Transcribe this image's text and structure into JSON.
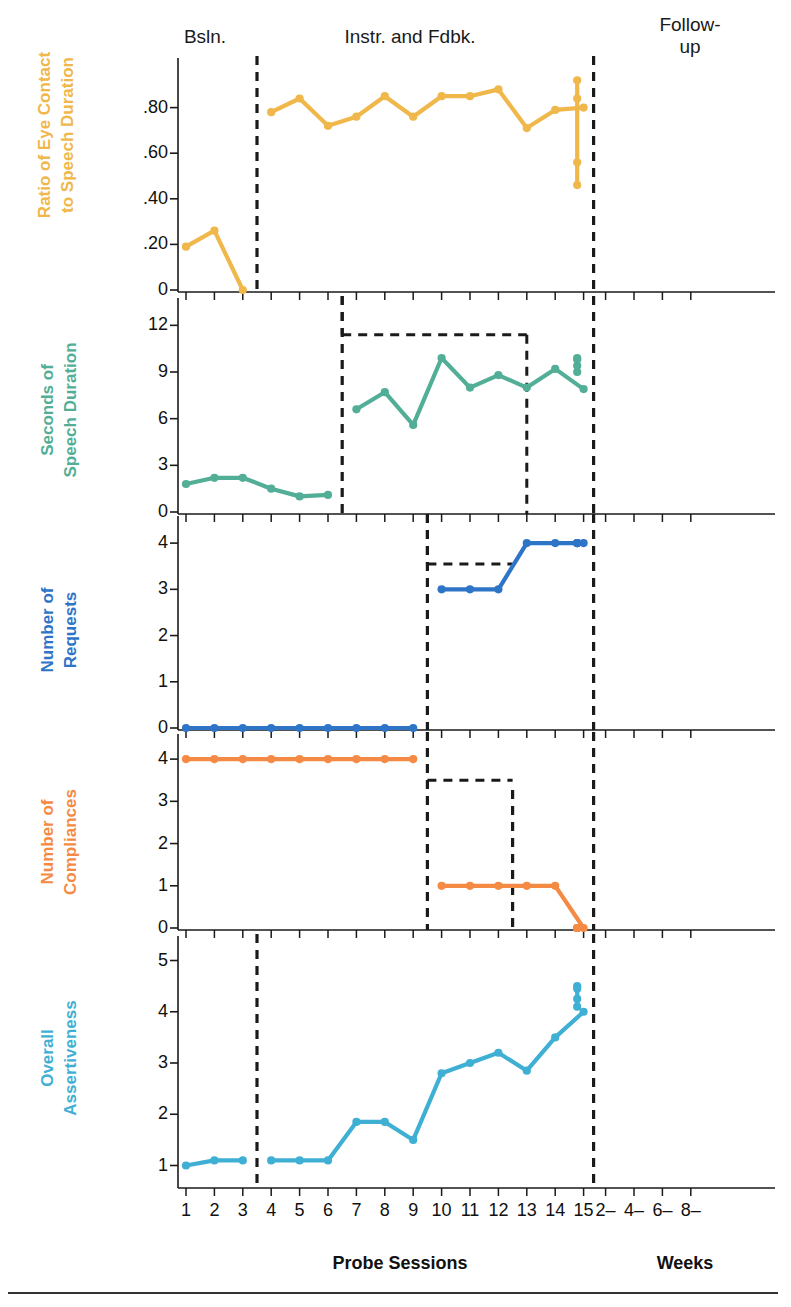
{
  "page": {
    "top_fragment": "",
    "background": "#ffffff"
  },
  "phase_labels": [
    {
      "name": "baseline",
      "text": "Bsln."
    },
    {
      "name": "intervention",
      "text": "Instr. and Fdbk."
    },
    {
      "name": "followup",
      "text": "Follow-\nup"
    }
  ],
  "phase_label_parts": {
    "baseline": "Bsln.",
    "intervention": "Instr. and Fdbk.",
    "followup_line1": "Follow-",
    "followup_line2": "up"
  },
  "axis": {
    "xlabel_sessions": "Probe Sessions",
    "xlabel_weeks": "Weeks",
    "session_ticks": [
      "1",
      "2",
      "3",
      "4",
      "5",
      "6",
      "7",
      "8",
      "9",
      "10",
      "11",
      "12",
      "13",
      "14",
      "15"
    ],
    "week_ticks": [
      "2–",
      "4–",
      "6–",
      "8–"
    ]
  },
  "colors": {
    "eye_contact": "#F0B74A",
    "speech": "#52AE96",
    "requests": "#2E75C8",
    "compliances": "#F58A44",
    "assertiveness": "#3FAFD4",
    "axis": "#1a1a1a",
    "phase_line": "#1a1a1a",
    "criterion_line": "#1a1a1a"
  },
  "chart_data": [
    {
      "type": "line",
      "panel": 1,
      "title": "",
      "ylabel": "Ratio of Eye Contact to Speech Duration",
      "ylabel_line1": "Ratio of Eye Contact",
      "ylabel_line2": "to Speech Duration",
      "xlabel": "Probe Sessions",
      "ylim": [
        0,
        1.0
      ],
      "yticks": [
        0,
        0.2,
        0.4,
        0.6,
        0.8
      ],
      "ytick_labels": [
        "0",
        ".20",
        ".40",
        ".60",
        ".80"
      ],
      "grid": false,
      "legend": "none",
      "color": "#F0B74A",
      "series": [
        {
          "name": "Baseline",
          "x": [
            1,
            2,
            3
          ],
          "values": [
            0.19,
            0.26,
            0.0
          ]
        },
        {
          "name": "Instruction and Feedback",
          "x": [
            4,
            5,
            6,
            7,
            8,
            9,
            10,
            11,
            12,
            13,
            14,
            15
          ],
          "values": [
            0.78,
            0.84,
            0.72,
            0.76,
            0.85,
            0.76,
            0.85,
            0.85,
            0.88,
            0.71,
            0.79,
            0.8
          ]
        },
        {
          "name": "Follow-up",
          "x": [
            "2-",
            "4-",
            "6-",
            "8-"
          ],
          "values": [
            0.56,
            0.92,
            0.84,
            0.46
          ]
        }
      ]
    },
    {
      "type": "line",
      "panel": 2,
      "ylabel": "Seconds of Speech Duration",
      "ylabel_line1": "Seconds of",
      "ylabel_line2": "Speech Duration",
      "ylim": [
        0,
        13.5
      ],
      "yticks": [
        0,
        3,
        6,
        9,
        12
      ],
      "ytick_labels": [
        "0",
        "3",
        "6",
        "9",
        "12"
      ],
      "grid": false,
      "legend": "none",
      "color": "#52AE96",
      "criterion_steps": [
        {
          "from_x": 6.5,
          "to_x": 13.0,
          "value": 11.4
        }
      ],
      "series": [
        {
          "name": "Baseline",
          "x": [
            1,
            2,
            3,
            4,
            5,
            6
          ],
          "values": [
            1.8,
            2.2,
            2.2,
            1.5,
            1.0,
            1.1
          ]
        },
        {
          "name": "Instruction and Feedback",
          "x": [
            7,
            8,
            9,
            10,
            11,
            12,
            13,
            14,
            15
          ],
          "values": [
            6.6,
            7.7,
            5.6,
            9.9,
            8.0,
            8.8,
            8.0,
            9.2,
            7.9
          ]
        },
        {
          "name": "Follow-up",
          "x": [
            "2-",
            "4-",
            "6-",
            "8-"
          ],
          "values": [
            9.4,
            9.8,
            9.0,
            9.9
          ]
        }
      ]
    },
    {
      "type": "line",
      "panel": 3,
      "ylabel": "Number of Requests",
      "ylabel_line1": "Number of",
      "ylabel_line2": "Requests",
      "ylim": [
        0,
        4.5
      ],
      "yticks": [
        0,
        1,
        2,
        3,
        4
      ],
      "ytick_labels": [
        "0",
        "1",
        "2",
        "3",
        "4"
      ],
      "grid": false,
      "legend": "none",
      "color": "#2E75C8",
      "criterion_steps": [
        {
          "from_x": 9.5,
          "to_x": 12.5,
          "value": 3.5
        }
      ],
      "series": [
        {
          "name": "Baseline",
          "x": [
            1,
            2,
            3,
            4,
            5,
            6,
            7,
            8,
            9
          ],
          "values": [
            0,
            0,
            0,
            0,
            0,
            0,
            0,
            0,
            0
          ]
        },
        {
          "name": "Instruction and Feedback",
          "x": [
            10,
            11,
            12,
            13,
            14,
            15
          ],
          "values": [
            3,
            3,
            3,
            4,
            4,
            4
          ]
        },
        {
          "name": "Follow-up",
          "x": [
            "2-",
            "4-",
            "6-",
            "8-"
          ],
          "values": [
            4,
            4,
            4,
            4
          ]
        }
      ]
    },
    {
      "type": "line",
      "panel": 4,
      "ylabel": "Number of Compliances",
      "ylabel_line1": "Number of",
      "ylabel_line2": "Compliances",
      "ylim": [
        0,
        4.5
      ],
      "yticks": [
        0,
        1,
        2,
        3,
        4
      ],
      "ytick_labels": [
        "0",
        "1",
        "2",
        "3",
        "4"
      ],
      "grid": false,
      "legend": "none",
      "color": "#F58A44",
      "criterion_steps": [
        {
          "from_x": 9.5,
          "to_x": 13.0,
          "value": 3.5
        }
      ],
      "series": [
        {
          "name": "Baseline",
          "x": [
            1,
            2,
            3,
            4,
            5,
            6,
            7,
            8,
            9
          ],
          "values": [
            4,
            4,
            4,
            4,
            4,
            4,
            4,
            4,
            4
          ]
        },
        {
          "name": "Instruction and Feedback",
          "x": [
            10,
            11,
            12,
            13,
            14,
            15
          ],
          "values": [
            1,
            1,
            1,
            1,
            1,
            0
          ]
        },
        {
          "name": "Follow-up",
          "x": [
            "2-",
            "4-",
            "6-",
            "8-"
          ],
          "values": [
            0,
            0,
            0,
            0
          ]
        }
      ]
    },
    {
      "type": "line",
      "panel": 5,
      "ylabel": "Overall Assertiveness",
      "ylabel_line1": "Overall",
      "ylabel_line2": "Assertiveness",
      "ylim": [
        0.6,
        5.4
      ],
      "yticks": [
        1,
        2,
        3,
        4,
        5
      ],
      "ytick_labels": [
        "1",
        "2",
        "3",
        "4",
        "5"
      ],
      "grid": false,
      "legend": "none",
      "color": "#3FAFD4",
      "series": [
        {
          "name": "Baseline",
          "x": [
            1,
            2,
            3
          ],
          "values": [
            1.0,
            1.1,
            1.1
          ]
        },
        {
          "name": "Instruction and Feedback",
          "x": [
            4,
            5,
            6,
            7,
            8,
            9,
            10,
            11,
            12,
            13,
            14,
            15
          ],
          "values": [
            1.1,
            1.1,
            1.1,
            1.85,
            1.85,
            1.5,
            2.8,
            3.0,
            3.2,
            2.85,
            3.5,
            4.0
          ]
        },
        {
          "name": "Follow-up",
          "x": [
            "2-",
            "4-",
            "6-",
            "8-"
          ],
          "values": [
            4.5,
            4.25,
            4.45,
            4.1
          ]
        }
      ]
    }
  ]
}
